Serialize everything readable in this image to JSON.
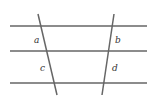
{
  "diagram": {
    "type": "parallel-lines-with-transversals",
    "line_color": "#666666",
    "label_color": "#333333",
    "horizontal_lines": [
      {
        "x1": 10,
        "y1": 26,
        "x2": 147,
        "y2": 26
      },
      {
        "x1": 10,
        "y1": 51,
        "x2": 147,
        "y2": 51
      },
      {
        "x1": 10,
        "y1": 83,
        "x2": 147,
        "y2": 83
      }
    ],
    "transversals": [
      {
        "x1": 38,
        "y1": 14,
        "x2": 57,
        "y2": 95
      },
      {
        "x1": 114,
        "y1": 14,
        "x2": 102,
        "y2": 95
      }
    ],
    "labels": {
      "a": "a",
      "b": "b",
      "c": "c",
      "d": "d"
    }
  }
}
